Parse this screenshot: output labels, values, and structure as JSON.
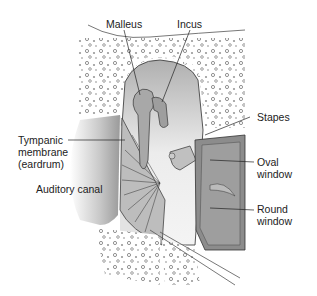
{
  "diagram": {
    "labels": {
      "malleus": "Malleus",
      "incus": "Incus",
      "stapes": "Stapes",
      "tympanic": "Tympanic\nmembrane\n(eardrum)",
      "auditory_canal": "Auditory canal",
      "oval_window": "Oval\nwindow",
      "round_window": "Round\nwindow"
    }
  }
}
